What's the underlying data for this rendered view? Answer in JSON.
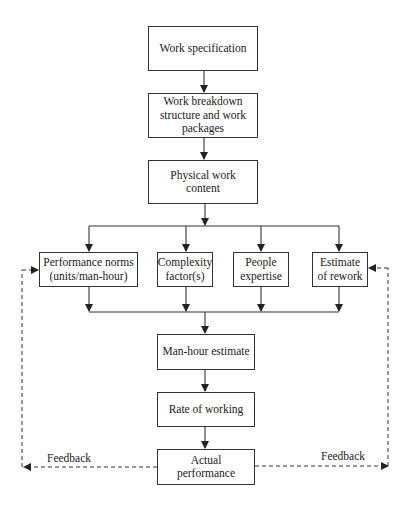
{
  "diagram": {
    "type": "flowchart",
    "nodes": {
      "work_spec": "Work specification",
      "wbs": "Work breakdown structure and work packages",
      "physical": "Physical work content",
      "norms": "Performance norms (units/man-hour)",
      "complexity": "Complexity factor(s)",
      "expertise": "People expertise",
      "rework": "Estimate of rework",
      "manhour": "Man-hour estimate",
      "rate": "Rate of working",
      "actual": "Actual performance"
    },
    "edge_labels": {
      "feedback_left": "Feedback",
      "feedback_right": "Feedback"
    },
    "edges": [
      [
        "work_spec",
        "wbs"
      ],
      [
        "wbs",
        "physical"
      ],
      [
        "physical",
        "norms"
      ],
      [
        "physical",
        "complexity"
      ],
      [
        "physical",
        "expertise"
      ],
      [
        "physical",
        "rework"
      ],
      [
        "norms",
        "manhour"
      ],
      [
        "complexity",
        "manhour"
      ],
      [
        "expertise",
        "manhour"
      ],
      [
        "rework",
        "manhour"
      ],
      [
        "manhour",
        "rate"
      ],
      [
        "rate",
        "actual"
      ],
      [
        "actual",
        "norms",
        "Feedback (dashed)"
      ],
      [
        "actual",
        "rework",
        "Feedback (dashed)"
      ]
    ]
  }
}
